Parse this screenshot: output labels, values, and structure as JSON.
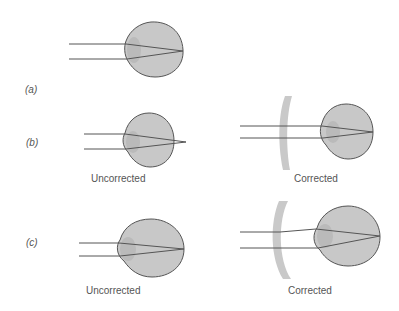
{
  "figure": {
    "panels": [
      {
        "id": "a",
        "label": "(a)",
        "caption": ""
      },
      {
        "id": "b",
        "label": "(b)",
        "uncorrected_caption": "Uncorrected",
        "corrected_caption": "Corrected"
      },
      {
        "id": "c",
        "label": "(c)",
        "uncorrected_caption": "Uncorrected",
        "corrected_caption": "Corrected"
      }
    ],
    "colors": {
      "eye_fill": "#c8c8c8",
      "eye_stroke": "#555555",
      "lens_fill": "#c9c9c9",
      "ray": "#555555",
      "text": "#555555"
    }
  }
}
